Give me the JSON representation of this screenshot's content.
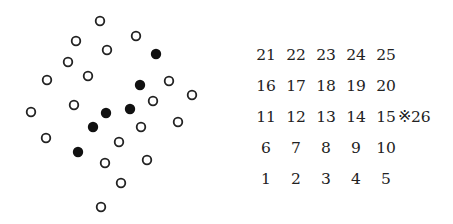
{
  "diagram": {
    "open_circles": [
      [
        100,
        21
      ],
      [
        76,
        41
      ],
      [
        136,
        36
      ],
      [
        107,
        50
      ],
      [
        68,
        62
      ],
      [
        88,
        76
      ],
      [
        47,
        80
      ],
      [
        169,
        81
      ],
      [
        192,
        95
      ],
      [
        153,
        101
      ],
      [
        74,
        105
      ],
      [
        31,
        112
      ],
      [
        141,
        127
      ],
      [
        178,
        122
      ],
      [
        46,
        138
      ],
      [
        119,
        142
      ],
      [
        105,
        163
      ],
      [
        147,
        160
      ],
      [
        121,
        183
      ],
      [
        101,
        207
      ]
    ],
    "filled_circles": [
      [
        156,
        54
      ],
      [
        140,
        85
      ],
      [
        130,
        109
      ],
      [
        106,
        113
      ],
      [
        93,
        127
      ],
      [
        78,
        152
      ]
    ],
    "colors": {
      "stroke": "#222222",
      "fill": "#111111"
    }
  },
  "grid": {
    "rows": [
      [
        "21",
        "22",
        "23",
        "24",
        "25"
      ],
      [
        "16",
        "17",
        "18",
        "19",
        "20"
      ],
      [
        "11",
        "12",
        "13",
        "14",
        "15"
      ],
      [
        "6",
        "7",
        "8",
        "9",
        "10"
      ],
      [
        "1",
        "2",
        "3",
        "4",
        "5"
      ]
    ],
    "extra": "※26"
  }
}
